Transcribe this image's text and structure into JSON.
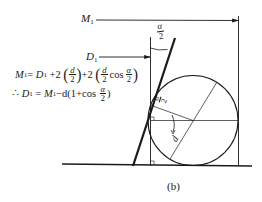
{
  "figure": {
    "caption": "(b)",
    "labels": {
      "M1": {
        "main": "M",
        "sub": "1"
      },
      "D1": {
        "main": "D",
        "sub": "1"
      },
      "half_angle_top": {
        "num": "α",
        "den": "2"
      },
      "half_angle_inner": {
        "num": "α",
        "den": "2"
      },
      "diameter": "d"
    },
    "formulas": [
      {
        "lhs": "M₁",
        "eq": "=",
        "parts": [
          "D₁",
          "+2",
          "(",
          "d/2",
          ")",
          "+2",
          "(",
          "d/2",
          "cos",
          "α/2",
          ")"
        ],
        "text": "M₁= D₁ +2 (d/2)+2 (d/2 cos α/2)"
      },
      {
        "prefix": "∴",
        "lhs": "D₁",
        "eq": "=",
        "text": "∴ D₁ = M₁−d(1+cos α/2)"
      }
    ],
    "formula_tokens": {
      "f1_M": "M",
      "f1_sub1": "1",
      "f1_eq": "=",
      "f1_D": "D",
      "f1_sub2": "1",
      "f1_plus2a": "+2",
      "f1_frac1_num": "d",
      "f1_frac1_den": "2",
      "f1_plus2b": "+2",
      "f1_frac2_num": "d",
      "f1_frac2_den": "2",
      "f1_cos": "cos",
      "f1_frac3_num": "α",
      "f1_frac3_den": "2",
      "f2_therefore": "∴",
      "f2_D": "D",
      "f2_sub1": "1",
      "f2_eq": "=",
      "f2_M": "M",
      "f2_sub2": "1",
      "f2_rest": "−d(1+cos",
      "f2_frac_num": "α",
      "f2_frac_den": "2",
      "f2_close": ")"
    },
    "colors": {
      "stroke": "#1a1a1a",
      "background": "#ffffff"
    }
  }
}
